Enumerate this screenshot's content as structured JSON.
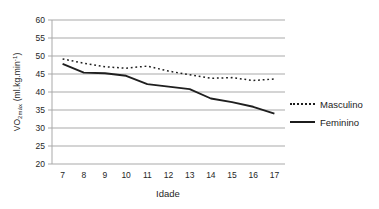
{
  "colors": {
    "grid": "#a9a9a9",
    "axis": "#a9a9a9",
    "tick_text": "#262626",
    "series": "#1f1f1f"
  },
  "y_axis": {
    "label_main": "VO",
    "label_sub": "2máx",
    "label_unit_pre": " (ml.kg.min",
    "label_sup": "-1",
    "label_unit_post": ")"
  },
  "chart_data": {
    "type": "line",
    "title": "",
    "xlabel": "Idade",
    "ylabel": "VO2máx (ml.kg.min-1)",
    "x": [
      7,
      8,
      9,
      10,
      11,
      12,
      13,
      14,
      15,
      16,
      17
    ],
    "yticks": [
      20,
      25,
      30,
      35,
      40,
      45,
      50,
      55,
      60
    ],
    "ylim": [
      20,
      60
    ],
    "grid": "horizontal",
    "legend_position": "right",
    "series": [
      {
        "name": "Masculino",
        "style": "dotted",
        "values": [
          49.2,
          48.0,
          47.0,
          46.6,
          47.2,
          45.8,
          44.8,
          43.8,
          44.0,
          43.2,
          43.6
        ]
      },
      {
        "name": "Feminino",
        "style": "solid",
        "values": [
          47.8,
          45.4,
          45.2,
          44.5,
          42.2,
          41.5,
          40.8,
          38.2,
          37.2,
          35.9,
          34.0
        ]
      }
    ]
  }
}
